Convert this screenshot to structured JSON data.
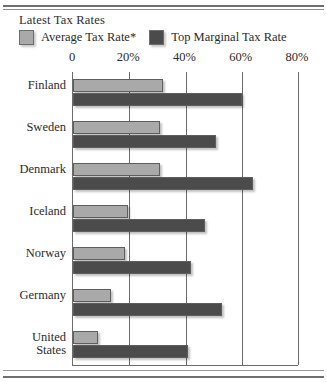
{
  "chart_data": {
    "type": "bar",
    "orientation": "horizontal",
    "title": "Latest Tax Rates",
    "xlabel": "",
    "ylabel": "",
    "xlim": [
      0,
      80
    ],
    "xticks": [
      0,
      20,
      40,
      60,
      80
    ],
    "xtick_labels": [
      "0",
      "20%",
      "40%",
      "60%",
      "80%"
    ],
    "grid": true,
    "legend_position": "top-left",
    "categories": [
      "Finland",
      "Sweden",
      "Denmark",
      "Iceland",
      "Norway",
      "Germany",
      "United States"
    ],
    "series": [
      {
        "name": "Average Tax Rate*",
        "color": "#a9a9a9",
        "values": [
          32,
          31,
          31,
          19.5,
          18.5,
          13.5,
          9
        ]
      },
      {
        "name": "Top Marginal Tax Rate",
        "color": "#4b4b4b",
        "values": [
          60,
          51,
          64,
          47,
          42,
          53,
          41
        ]
      }
    ]
  },
  "legend": {
    "items": [
      {
        "label": "Average Tax Rate*",
        "color": "#a9a9a9"
      },
      {
        "label": "Top Marginal Tax Rate",
        "color": "#4b4b4b"
      }
    ]
  },
  "category_lines": [
    [
      "Finland"
    ],
    [
      "Sweden"
    ],
    [
      "Denmark"
    ],
    [
      "Iceland"
    ],
    [
      "Norway"
    ],
    [
      "Germany"
    ],
    [
      "United",
      "States"
    ]
  ]
}
